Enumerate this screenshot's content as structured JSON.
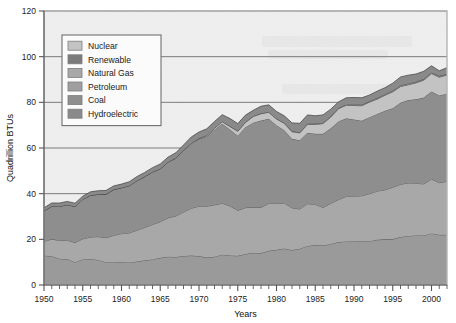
{
  "chart_data": {
    "type": "area",
    "stacked": true,
    "title": "",
    "xlabel": "Years",
    "ylabel": "Quadrillion BTUs",
    "xlim": [
      1950,
      2002
    ],
    "ylim": [
      0,
      120
    ],
    "ytick_values": [
      0,
      20,
      40,
      60,
      80,
      100,
      120
    ],
    "ytick_labels": [
      "0",
      "20",
      "40",
      "60",
      "80",
      "100",
      "120"
    ],
    "xtick_values": [
      1950,
      1955,
      1960,
      1965,
      1970,
      1975,
      1980,
      1985,
      1990,
      1995,
      2000
    ],
    "xtick_labels": [
      "1950",
      "1955",
      "1960",
      "1965",
      "1970",
      "1975",
      "1980",
      "1985",
      "1990",
      "1995",
      "2000"
    ],
    "minor_xtick_interval": 1,
    "grid": "horizontal",
    "legend_position": "top-left-inset",
    "legend_entries": [
      "Nuclear",
      "Renewable",
      "Natural Gas",
      "Petroleum",
      "Coal",
      "Hydroelectric"
    ],
    "x": [
      1950,
      1951,
      1952,
      1953,
      1954,
      1955,
      1956,
      1957,
      1958,
      1959,
      1960,
      1961,
      1962,
      1963,
      1964,
      1965,
      1966,
      1967,
      1968,
      1969,
      1970,
      1971,
      1972,
      1973,
      1974,
      1975,
      1976,
      1977,
      1978,
      1979,
      1980,
      1981,
      1982,
      1983,
      1984,
      1985,
      1986,
      1987,
      1988,
      1989,
      1990,
      1991,
      1992,
      1993,
      1994,
      1995,
      1996,
      1997,
      1998,
      1999,
      2000,
      2001,
      2002
    ],
    "stack_order_bottom_to_top": [
      "Coal",
      "Natural Gas",
      "Petroleum",
      "Nuclear",
      "Renewable",
      "Hydroelectric"
    ],
    "series": [
      {
        "name": "Coal",
        "color": "#9a9a9a",
        "values": [
          12.9,
          12.6,
          11.5,
          11.4,
          10.0,
          11.2,
          11.4,
          11.0,
          10.0,
          10.0,
          10.1,
          9.9,
          10.3,
          10.8,
          11.2,
          11.9,
          12.4,
          12.3,
          12.7,
          12.9,
          12.7,
          12.0,
          12.4,
          13.3,
          12.9,
          12.8,
          13.6,
          14.1,
          14.0,
          15.0,
          15.4,
          16.0,
          15.3,
          15.9,
          17.1,
          17.5,
          17.3,
          18.0,
          18.8,
          19.1,
          19.2,
          19.0,
          19.2,
          19.8,
          20.0,
          20.1,
          21.0,
          21.5,
          21.7,
          21.7,
          22.6,
          22.0,
          22.0
        ]
      },
      {
        "name": "Natural Gas",
        "color": "#a8a8a8",
        "values": [
          6.2,
          7.5,
          8.0,
          8.2,
          8.6,
          9.0,
          9.6,
          10.2,
          10.7,
          11.7,
          12.4,
          12.9,
          13.7,
          14.4,
          15.3,
          15.8,
          17.0,
          17.9,
          19.2,
          20.7,
          21.8,
          22.5,
          22.7,
          22.5,
          21.7,
          19.9,
          20.3,
          19.9,
          20.0,
          20.7,
          20.4,
          19.9,
          18.5,
          17.4,
          18.5,
          17.8,
          16.7,
          17.7,
          18.6,
          19.7,
          19.7,
          20.1,
          20.8,
          21.3,
          21.7,
          22.7,
          23.1,
          23.2,
          22.8,
          22.6,
          23.8,
          22.8,
          23.4
        ]
      },
      {
        "name": "Petroleum",
        "color": "#8e8e8e",
        "values": [
          13.3,
          14.4,
          14.9,
          15.6,
          15.8,
          17.3,
          18.3,
          18.5,
          19.1,
          20.1,
          20.1,
          20.7,
          21.7,
          22.3,
          23.0,
          23.2,
          24.4,
          25.3,
          27.0,
          28.3,
          29.5,
          30.6,
          32.9,
          34.8,
          33.5,
          32.7,
          35.2,
          37.1,
          38.0,
          37.1,
          34.2,
          31.9,
          30.2,
          30.1,
          31.1,
          30.9,
          32.2,
          32.9,
          34.2,
          34.2,
          33.6,
          32.8,
          33.5,
          33.8,
          34.6,
          34.6,
          35.7,
          36.3,
          36.8,
          37.8,
          38.3,
          38.2,
          38.4
        ]
      },
      {
        "name": "Nuclear",
        "color": "#c3c3c3",
        "values": [
          0.0,
          0.0,
          0.0,
          0.0,
          0.0,
          0.0,
          0.0,
          0.0,
          0.0,
          0.0,
          0.0,
          0.0,
          0.0,
          0.0,
          0.0,
          0.0,
          0.1,
          0.1,
          0.1,
          0.2,
          0.2,
          0.4,
          0.6,
          0.9,
          1.3,
          1.9,
          2.1,
          2.7,
          3.0,
          2.8,
          2.7,
          3.0,
          3.1,
          3.2,
          3.6,
          4.1,
          4.5,
          4.9,
          5.6,
          5.7,
          6.1,
          6.6,
          6.6,
          6.5,
          6.8,
          7.2,
          7.1,
          6.7,
          7.2,
          7.6,
          7.9,
          8.0,
          8.1
        ]
      },
      {
        "name": "Renewable",
        "color": "#7b7b7b",
        "values": [
          0.0,
          0.0,
          0.0,
          0.0,
          0.0,
          0.0,
          0.0,
          0.0,
          0.0,
          0.0,
          0.0,
          0.0,
          0.0,
          0.0,
          0.0,
          0.0,
          0.0,
          0.0,
          0.0,
          0.0,
          0.1,
          0.1,
          0.1,
          0.1,
          0.2,
          0.2,
          0.2,
          0.2,
          0.2,
          0.2,
          0.2,
          0.2,
          0.3,
          0.3,
          0.4,
          0.4,
          0.4,
          0.4,
          0.4,
          0.4,
          0.5,
          0.5,
          0.5,
          0.6,
          0.6,
          0.6,
          0.6,
          0.6,
          0.6,
          0.6,
          0.6,
          0.6,
          0.6
        ]
      },
      {
        "name": "Hydroelectric",
        "color": "#8a8a8a",
        "values": [
          1.4,
          1.4,
          1.5,
          1.4,
          1.4,
          1.4,
          1.5,
          1.6,
          1.6,
          1.6,
          1.6,
          1.7,
          1.8,
          1.8,
          1.9,
          2.1,
          2.1,
          2.3,
          2.3,
          2.7,
          2.7,
          2.8,
          2.9,
          3.0,
          3.3,
          3.2,
          3.0,
          2.5,
          3.1,
          3.1,
          3.1,
          3.1,
          3.6,
          3.9,
          3.8,
          3.4,
          3.4,
          3.1,
          2.6,
          2.9,
          3.0,
          3.0,
          2.6,
          2.9,
          2.7,
          3.2,
          3.6,
          3.6,
          3.3,
          3.3,
          2.8,
          2.2,
          2.7
        ]
      }
    ],
    "totals_reference": {
      "1950": 33.8,
      "1955": 38.9,
      "1960": 44.2,
      "1965": 53.0,
      "1970": 67.0,
      "1973": 74.6,
      "1975": 70.7,
      "1979": 78.9,
      "1983": 70.8,
      "1990": 82.1,
      "1995": 88.4,
      "2000": 96.0,
      "2002": 95.2
    }
  },
  "axes": {
    "ylabel": "Quadrillion BTUs",
    "xlabel": "Years"
  },
  "legend": {
    "items": [
      {
        "label": "Nuclear",
        "color": "#c3c3c3"
      },
      {
        "label": "Renewable",
        "color": "#7b7b7b"
      },
      {
        "label": "Natural Gas",
        "color": "#a8a8a8"
      },
      {
        "label": "Petroleum",
        "color": "#9f9f9f"
      },
      {
        "label": "Coal",
        "color": "#8e8e8e"
      },
      {
        "label": "Hydroelectric",
        "color": "#8a8a8a"
      }
    ]
  },
  "style": {
    "plot_background": "#efefef",
    "frame_color": "#b4b4b4",
    "gridline_color": "#6e6e6e",
    "outline_color": "#4a4a4a",
    "legend_background": "#fbfbfb",
    "legend_border": "#6f6f6f",
    "text_color": "#1a1a1a"
  }
}
